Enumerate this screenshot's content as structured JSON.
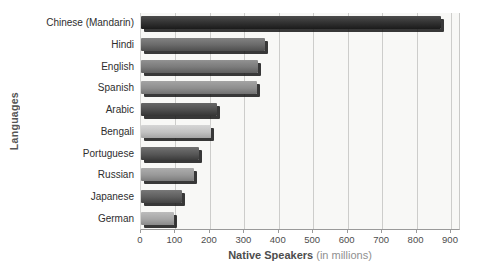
{
  "chart_data": {
    "type": "bar",
    "orientation": "horizontal",
    "title": "",
    "xlabel": "Native Speakers (in millions)",
    "ylabel": "Languages",
    "xlim": [
      0,
      900
    ],
    "xticks": [
      0,
      100,
      200,
      300,
      400,
      500,
      600,
      700,
      800,
      900
    ],
    "grid": "vertical",
    "legend": "none",
    "categories": [
      "Chinese (Mandarin)",
      "Hindi",
      "English",
      "Spanish",
      "Arabic",
      "Bengali",
      "Portuguese",
      "Russian",
      "Japanese",
      "German"
    ],
    "values": [
      870,
      360,
      340,
      338,
      222,
      202,
      168,
      155,
      120,
      95
    ],
    "bar_styles": [
      {
        "light": "#4c4c4c",
        "base": "#303030",
        "dark": "#1b1b1b"
      },
      {
        "light": "#828282",
        "base": "#696969",
        "dark": "#4e4e4e"
      },
      {
        "light": "#929292",
        "base": "#7a7a7a",
        "dark": "#5f5f5f"
      },
      {
        "light": "#a4a4a4",
        "base": "#8e8e8e",
        "dark": "#717171"
      },
      {
        "light": "#676767",
        "base": "#4d4d4d",
        "dark": "#343434"
      },
      {
        "light": "#d6d6d6",
        "base": "#c2c2c2",
        "dark": "#a5a5a5"
      },
      {
        "light": "#717171",
        "base": "#575757",
        "dark": "#3c3c3c"
      },
      {
        "light": "#adadad",
        "base": "#989898",
        "dark": "#7c7c7c"
      },
      {
        "light": "#787878",
        "base": "#5e5e5e",
        "dark": "#434343"
      },
      {
        "light": "#bcbcbc",
        "base": "#a6a6a6",
        "dark": "#8a8a8a"
      }
    ]
  },
  "labels": {
    "x_axis_bold": "Native Speakers",
    "x_axis_light": "(in millions)",
    "y_axis": "Languages"
  },
  "colors": {
    "plot_background": "#f8f8f6",
    "gridline": "#cdcdcb",
    "axis_line": "#9a9a9a",
    "category_text": "#2e2e2e",
    "tick_text": "#4d4d4d",
    "x_title_bold": "#4d4d4d",
    "x_title_light": "#909090",
    "y_title": "#555555",
    "bar_shadow": "#161616"
  }
}
